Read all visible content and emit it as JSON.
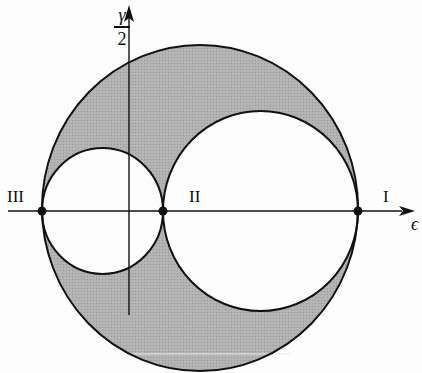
{
  "diagram": {
    "axes": {
      "x_label": "ϵ",
      "y_label_numerator": "γ",
      "y_label_denominator": "2"
    },
    "points": [
      {
        "id": "I",
        "label": "I",
        "x": 358
      },
      {
        "id": "II",
        "label": "II",
        "x": 163
      },
      {
        "id": "III",
        "label": "III",
        "x": 42
      }
    ],
    "circles": [
      {
        "name": "outer-circle",
        "between": [
          "III",
          "I"
        ]
      },
      {
        "name": "circle-II-I",
        "between": [
          "II",
          "I"
        ]
      },
      {
        "name": "circle-III-II",
        "between": [
          "III",
          "II"
        ]
      }
    ],
    "colors": {
      "shading": "#a9a9a9",
      "stroke": "#111111",
      "background": "#fdfdfd"
    }
  }
}
